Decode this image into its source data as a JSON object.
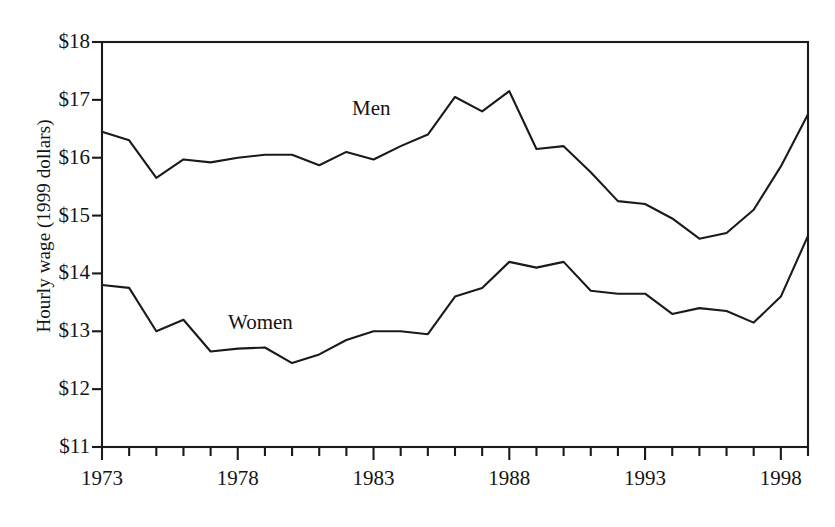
{
  "chart_data": {
    "type": "line",
    "title": "",
    "xlabel": "",
    "ylabel": "Hourly wage (1999 dollars)",
    "ylim": [
      11,
      18
    ],
    "xlim": [
      1973,
      1999
    ],
    "ytick_labels": [
      "$18",
      "$17",
      "$16",
      "$15",
      "$14",
      "$13",
      "$12",
      "$11"
    ],
    "ytick_values": [
      18,
      17,
      16,
      15,
      14,
      13,
      12,
      11
    ],
    "xtick_labels": [
      "1973",
      "1978",
      "1983",
      "1988",
      "1993",
      "1998"
    ],
    "xtick_values": [
      1973,
      1978,
      1983,
      1988,
      1993,
      1998
    ],
    "grid": false,
    "legend_position": "inline-annotation",
    "x": [
      1973,
      1974,
      1975,
      1976,
      1977,
      1978,
      1979,
      1980,
      1981,
      1982,
      1983,
      1984,
      1985,
      1986,
      1987,
      1988,
      1989,
      1990,
      1991,
      1992,
      1993,
      1994,
      1995,
      1996,
      1997,
      1998,
      1999
    ],
    "series": [
      {
        "name": "Men",
        "label_text": "Men",
        "values": [
          16.45,
          16.3,
          15.65,
          15.97,
          15.92,
          16.0,
          16.05,
          16.05,
          15.87,
          16.1,
          15.97,
          16.2,
          16.4,
          17.05,
          16.8,
          17.15,
          16.15,
          16.2,
          15.75,
          15.25,
          15.2,
          14.95,
          14.6,
          14.7,
          15.1,
          15.85,
          16.75
        ]
      },
      {
        "name": "Women",
        "label_text": "Women",
        "values": [
          13.8,
          13.75,
          13.0,
          13.2,
          12.65,
          12.7,
          12.72,
          12.45,
          12.6,
          12.85,
          13.0,
          13.0,
          12.95,
          13.6,
          13.75,
          14.2,
          14.1,
          14.2,
          13.7,
          13.65,
          13.65,
          13.3,
          13.4,
          13.35,
          13.15,
          13.6,
          14.65
        ]
      }
    ]
  },
  "axes": {
    "y_title": "Hourly wage (1999 dollars)",
    "line_color": "#1a1a1a",
    "frame_color": "#1a1a1a"
  }
}
